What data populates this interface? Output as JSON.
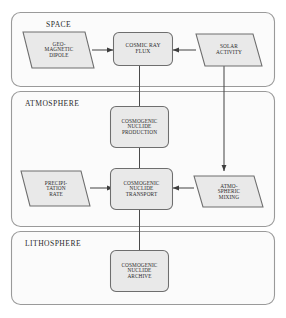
{
  "diagram": {
    "colors": {
      "node_fill": "#e9e9e9",
      "node_stroke": "#6e6e6e",
      "container_fill": "#fbfbfb",
      "container_stroke": "#9a9a9a",
      "connector": "#4a4a4a",
      "text": "#2b2b2b",
      "page_background": "#ffffff"
    },
    "sections": [
      {
        "id": "space",
        "label": "SPACE"
      },
      {
        "id": "atmosphere",
        "label": "ATMOSPHERE"
      },
      {
        "id": "lithosphere",
        "label": "LITHOSPHERE"
      }
    ],
    "nodes": [
      {
        "id": "geomagnetic-dipole",
        "shape": "parallelogram",
        "section": "space",
        "label": "GEO-\nMAGNETIC\nDIPOLE"
      },
      {
        "id": "cosmic-ray-flux",
        "shape": "rounded-rect",
        "section": "space",
        "label": "COSMIC RAY\nFLUX"
      },
      {
        "id": "solar-activity",
        "shape": "parallelogram",
        "section": "space",
        "label": "SOLAR\nACTIVITY"
      },
      {
        "id": "cosmogenic-nuclide-production",
        "shape": "rounded-rect",
        "section": "atmosphere",
        "label": "COSMOGENIC\nNUCLIDE\nPRODUCTION"
      },
      {
        "id": "precipitation-rate",
        "shape": "parallelogram",
        "section": "atmosphere",
        "label": "PRECIPI-\nTATION\nRATE"
      },
      {
        "id": "cosmogenic-nuclide-transport",
        "shape": "rounded-rect",
        "section": "atmosphere",
        "label": "COSMOGENIC\nNUCLIDE\nTRANSPORT"
      },
      {
        "id": "atmospheric-mixing",
        "shape": "parallelogram",
        "section": "atmosphere",
        "label": "ATMO-\nSPHERIC\nMIXING"
      },
      {
        "id": "cosmogenic-nuclide-archive",
        "shape": "rounded-rect",
        "section": "lithosphere",
        "label": "COSMOGENIC\nNUCLIDE\nARCHIVE"
      }
    ],
    "edges": [
      {
        "id": "dipole-to-flux",
        "from": "geomagnetic-dipole",
        "to": "cosmic-ray-flux",
        "arrow": true
      },
      {
        "id": "solar-to-flux",
        "from": "solar-activity",
        "to": "cosmic-ray-flux",
        "arrow": true
      },
      {
        "id": "flux-to-production",
        "from": "cosmic-ray-flux",
        "to": "cosmogenic-nuclide-production",
        "arrow": false
      },
      {
        "id": "production-to-transport",
        "from": "cosmogenic-nuclide-production",
        "to": "cosmogenic-nuclide-transport",
        "arrow": false
      },
      {
        "id": "precipitation-to-transport",
        "from": "precipitation-rate",
        "to": "cosmogenic-nuclide-transport",
        "arrow": true
      },
      {
        "id": "mixing-to-transport",
        "from": "atmospheric-mixing",
        "to": "cosmogenic-nuclide-transport",
        "arrow": true
      },
      {
        "id": "solar-to-mixing",
        "from": "solar-activity",
        "to": "atmospheric-mixing",
        "arrow": true
      },
      {
        "id": "transport-to-archive",
        "from": "cosmogenic-nuclide-transport",
        "to": "cosmogenic-nuclide-archive",
        "arrow": false
      }
    ]
  }
}
